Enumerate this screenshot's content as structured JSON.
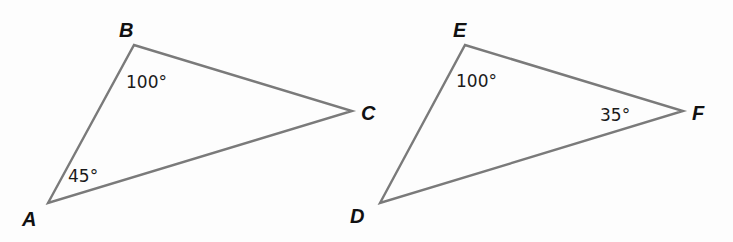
{
  "figure": {
    "triangles": [
      {
        "name": "ABC",
        "vertices": [
          {
            "label": "A",
            "x": 48,
            "y": 203
          },
          {
            "label": "B",
            "x": 134,
            "y": 45
          },
          {
            "label": "C",
            "x": 352,
            "y": 111
          }
        ],
        "angles": [
          {
            "at": "B",
            "text": "100°"
          },
          {
            "at": "A",
            "text": "45°"
          }
        ]
      },
      {
        "name": "DEF",
        "vertices": [
          {
            "label": "D",
            "x": 380,
            "y": 203
          },
          {
            "label": "E",
            "x": 465,
            "y": 45
          },
          {
            "label": "F",
            "x": 683,
            "y": 111
          }
        ],
        "angles": [
          {
            "at": "E",
            "text": "100°"
          },
          {
            "at": "F",
            "text": "35°"
          }
        ]
      }
    ],
    "colors": {
      "stroke": "#7a7a7a",
      "text": "#111111",
      "background": "#fdfdfd"
    }
  }
}
